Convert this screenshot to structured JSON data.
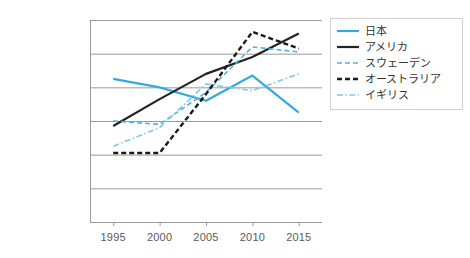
{
  "chart_data": {
    "type": "line",
    "title": "",
    "subtitle": "",
    "xlabel": "",
    "ylabel": "",
    "categories": [
      "1995",
      "2000",
      "2005",
      "2010",
      "2015"
    ],
    "x": [
      1995,
      2000,
      2005,
      2010,
      2015
    ],
    "ylim": [
      0,
      60000
    ],
    "ytick_values": [
      60000,
      50000,
      40000,
      30000,
      20000,
      10000,
      0
    ],
    "ytick_labels": [
      "$60,000.00",
      "$50,000.00",
      "$40,000.00",
      "$30,000.00",
      "$20,000.00",
      "$10,000.00",
      "$0.00"
    ],
    "xtick_labels": [
      "1995",
      "2000",
      "2005",
      "2010",
      "2015"
    ],
    "grid": "horizontal",
    "legend_position": "right",
    "series": [
      {
        "name": "日本",
        "values": [
          42500,
          40000,
          36000,
          43500,
          32500
        ],
        "color": "#36A8E0",
        "style": "solid",
        "width": 2.2
      },
      {
        "name": "アメリカ",
        "values": [
          28500,
          36500,
          44000,
          49000,
          56000
        ],
        "color": "#232323",
        "style": "solid",
        "width": 2.2
      },
      {
        "name": "スウェーデン",
        "values": [
          30000,
          29000,
          38500,
          52000,
          50500
        ],
        "color": "#4FB3E3",
        "style": "dashed",
        "width": 1.6
      },
      {
        "name": "オーストラリア",
        "values": [
          20500,
          20500,
          38000,
          56500,
          51500
        ],
        "color": "#1a1a1a",
        "style": "thick-dashed",
        "width": 2.4
      },
      {
        "name": "イギリス",
        "values": [
          22500,
          28000,
          41000,
          39000,
          44000
        ],
        "color": "#7DC8EC",
        "style": "dash-dot",
        "width": 1.6
      }
    ]
  },
  "axes": {
    "axis_color": "#9a9a9a",
    "grid_color": "#9a9a9a",
    "label_color": "#5a5a5a"
  },
  "legend": {
    "border_color": "#cfcfcf",
    "items": [
      {
        "label": "日本"
      },
      {
        "label": "アメリカ"
      },
      {
        "label": "スウェーデン"
      },
      {
        "label": "オーストラリア"
      },
      {
        "label": "イギリス"
      }
    ]
  }
}
